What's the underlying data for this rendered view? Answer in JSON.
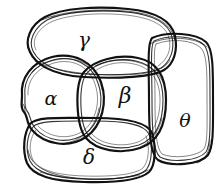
{
  "diagram": {
    "style": "sketchy-ink",
    "canvas": {
      "width": 218,
      "height": 191
    },
    "colors": {
      "ink": "#111111",
      "background": "#ffffff"
    },
    "regions": [
      {
        "id": "gamma",
        "label": "γ",
        "name": "gamma",
        "shape": "rounded-blob",
        "position": "top",
        "label_x": 84,
        "label_y": 40
      },
      {
        "id": "alpha",
        "label": "α",
        "name": "alpha",
        "shape": "circle-blob",
        "position": "left-center",
        "label_x": 51,
        "label_y": 98
      },
      {
        "id": "beta",
        "label": "β",
        "name": "beta",
        "shape": "circle-blob",
        "position": "center",
        "label_x": 125,
        "label_y": 96
      },
      {
        "id": "delta",
        "label": "δ",
        "name": "delta",
        "shape": "rounded-blob",
        "position": "bottom",
        "label_x": 89,
        "label_y": 157
      },
      {
        "id": "theta",
        "label": "θ",
        "name": "theta",
        "shape": "rounded-rect-blob",
        "position": "right",
        "label_x": 185,
        "label_y": 120
      }
    ]
  }
}
